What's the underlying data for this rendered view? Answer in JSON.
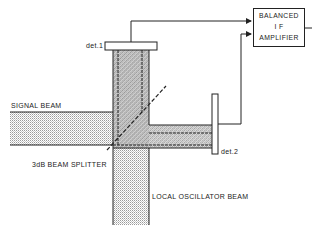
{
  "diagram": {
    "labels": {
      "det1": "det.1",
      "det2": "det.2",
      "signal_beam": "SIGNAL BEAM",
      "splitter": "3dB BEAM SPLITTER",
      "lo_beam": "LOCAL OSCILLATOR BEAM"
    },
    "amplifier": {
      "line1": "BALANCED",
      "line2": "I F",
      "line3": "AMPLIFIER"
    },
    "colors": {
      "line": "#222222",
      "beam_fill": "#cfcfcf",
      "overlap_fill": "#9a9a9a",
      "background": "#ffffff"
    }
  }
}
